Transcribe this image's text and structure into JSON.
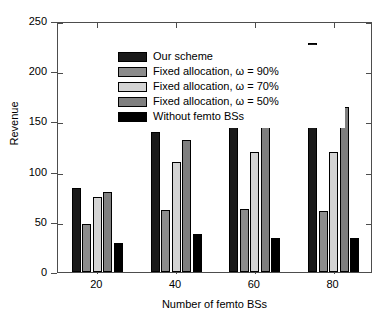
{
  "chart_data": {
    "type": "bar",
    "title": "",
    "xlabel": "Number of femto BSs",
    "ylabel": "Revenue",
    "categories": [
      "20",
      "40",
      "60",
      "80"
    ],
    "ylim": [
      0,
      250
    ],
    "yticks": [
      0,
      50,
      100,
      150,
      200,
      250
    ],
    "ytick_labels": [
      "0",
      "50",
      "100",
      "150",
      "200",
      "250"
    ],
    "grid": false,
    "legend_position": "upper left",
    "series": [
      {
        "name": "Our scheme",
        "color": "#1a1a1a",
        "values": [
          84,
          139,
          193,
          228
        ]
      },
      {
        "name": "Fixed allocation, ω = 90%",
        "color": "#8c8c8c",
        "values": [
          48,
          62,
          63,
          61
        ]
      },
      {
        "name": "Fixed allocation, ω = 70%",
        "color": "#d4d4d4",
        "values": [
          75,
          110,
          120,
          120
        ]
      },
      {
        "name": "Fixed allocation, ω = 50%",
        "color": "#7f7f7f",
        "values": [
          80,
          131,
          161,
          164
        ]
      },
      {
        "name": "Without femto BSs",
        "color": "#000000",
        "values": [
          29,
          38,
          34,
          34
        ]
      }
    ]
  },
  "axes": {
    "y_title": "Revenue",
    "x_title": "Number of femto BSs"
  },
  "legend": {
    "items": [
      {
        "label": "Our scheme"
      },
      {
        "label": "Fixed allocation, ω = 90%"
      },
      {
        "label": "Fixed allocation, ω = 70%"
      },
      {
        "label": "Fixed allocation, ω = 50%"
      },
      {
        "label": "Without femto BSs"
      }
    ]
  }
}
